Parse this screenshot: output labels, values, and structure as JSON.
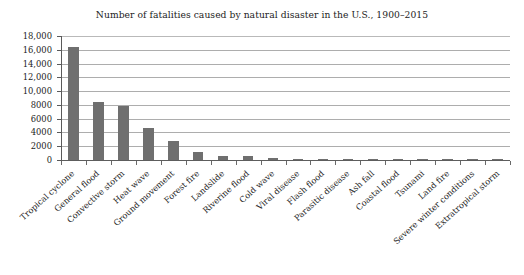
{
  "chart_data": {
    "type": "bar",
    "title": "Number of fatalities caused by natural disaster in the U.S., 1900–2015",
    "xlabel": "",
    "ylabel": "",
    "ylim": [
      0,
      18000
    ],
    "ytick_step": 2000,
    "grid": true,
    "legend": "none",
    "orientation": "vertical",
    "bar_color": "#6f6f6f",
    "categories": [
      "Tropical cyclone",
      "General flood",
      "Convective storm",
      "Heat wave",
      "Ground movement",
      "Forest fire",
      "Landslide",
      "Riverine flood",
      "Cold wave",
      "Viral disease",
      "Flash flood",
      "Parasitic disease",
      "Ash fall",
      "Coastal flood",
      "Tsunami",
      "Land fire",
      "Severe winter conditions",
      "Extratropical storm"
    ],
    "values": [
      16400,
      8400,
      7900,
      4700,
      2700,
      1100,
      620,
      600,
      330,
      160,
      120,
      60,
      40,
      30,
      25,
      20,
      15,
      10
    ],
    "ytick_labels": [
      "18,000",
      "16,000",
      "14,000",
      "12,000",
      "10,000",
      "8000",
      "6000",
      "4000",
      "2000",
      "0"
    ],
    "ytick_values": [
      18000,
      16000,
      14000,
      12000,
      10000,
      8000,
      6000,
      4000,
      2000,
      0
    ]
  }
}
